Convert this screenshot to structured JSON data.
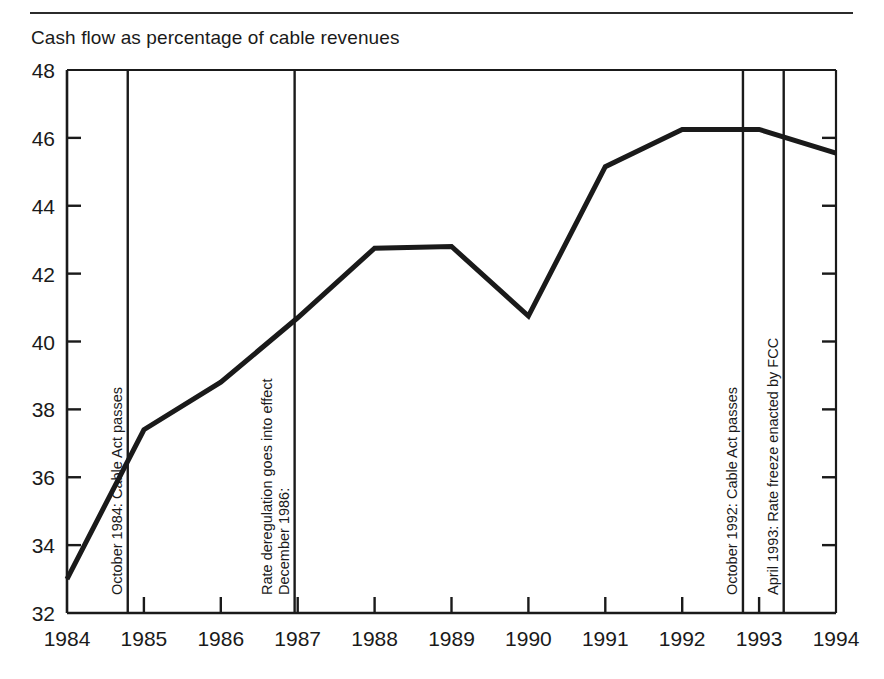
{
  "figure": {
    "title": "Cash flow as percentage of cable revenues",
    "has_top_rule": true,
    "line_color": "#1a1a1a",
    "axis_color": "#1a1a1a",
    "background": "#ffffff"
  },
  "chart_data": {
    "type": "line",
    "title": "Cash flow as percentage of cable revenues",
    "xlabel": "",
    "ylabel": "",
    "x": [
      1984,
      1985,
      1986,
      1987,
      1988,
      1989,
      1990,
      1991,
      1992,
      1993,
      1994
    ],
    "values": [
      33.0,
      37.4,
      38.8,
      40.7,
      42.75,
      42.8,
      40.75,
      45.15,
      46.25,
      46.25,
      45.55
    ],
    "series": [
      {
        "name": "Cash flow as percentage of cable revenues",
        "values": [
          33.0,
          37.4,
          38.8,
          40.7,
          42.75,
          42.8,
          40.75,
          45.15,
          46.25,
          46.25,
          45.55
        ]
      }
    ],
    "xlim": [
      1984,
      1994
    ],
    "ylim": [
      32,
      48
    ],
    "ytick_labels": [
      "32",
      "34",
      "36",
      "38",
      "40",
      "42",
      "44",
      "46",
      "48"
    ],
    "yticks": [
      32,
      34,
      36,
      38,
      40,
      42,
      44,
      46,
      48
    ],
    "xtick_labels": [
      "1984",
      "1985",
      "1986",
      "1987",
      "1988",
      "1989",
      "1990",
      "1991",
      "1992",
      "1993",
      "1994"
    ],
    "xticks": [
      1984,
      1985,
      1986,
      1987,
      1988,
      1989,
      1990,
      1991,
      1992,
      1993,
      1994
    ],
    "grid": false,
    "legend": null,
    "annotations": [
      {
        "id": "oct-1984-cable-act",
        "x": 1984.79,
        "lines": [
          "October 1984: Cable Act passes"
        ],
        "orientation": "vertical-line-with-rotated-label"
      },
      {
        "id": "dec-1986-rate-dereg",
        "x": 1986.96,
        "lines": [
          "December 1986:",
          "Rate deregulation goes into effect"
        ],
        "orientation": "vertical-line-with-rotated-label"
      },
      {
        "id": "oct-1992-cable-act",
        "x": 1992.79,
        "lines": [
          "October 1992: Cable Act passes"
        ],
        "orientation": "vertical-line-with-rotated-label"
      },
      {
        "id": "apr-1993-rate-freeze",
        "x": 1993.32,
        "lines": [
          "April 1993: Rate freeze enacted by FCC"
        ],
        "orientation": "vertical-line-with-rotated-label"
      }
    ]
  }
}
